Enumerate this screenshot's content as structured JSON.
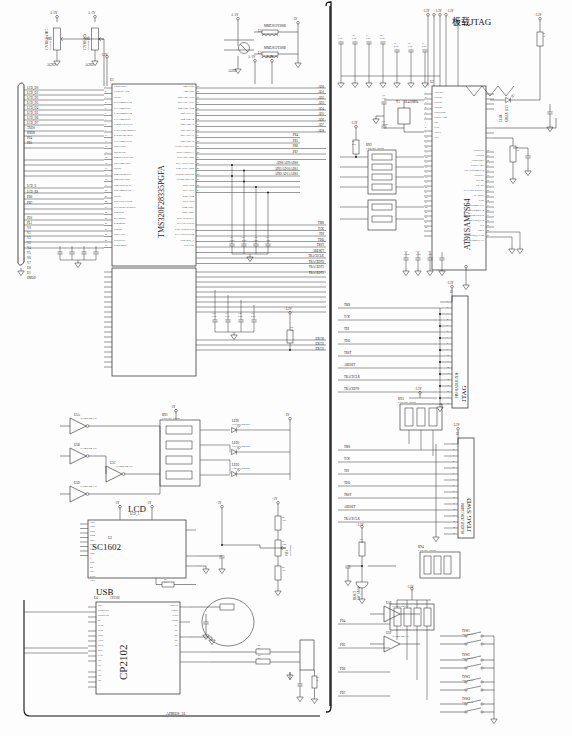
{
  "sheet": {
    "title": "AT91SAM7S64 Development Board Schematic",
    "bottom_net": "ADBUS_31"
  },
  "sections": {
    "onboard_jtag": "板载JTAG",
    "lcd": "LCD",
    "usb": "USB",
    "jtag_swd": "JTAG SWD",
    "jtag_20pin": "JTAG"
  },
  "components": {
    "mcu": {
      "refdes": "U1",
      "part": "TMS320F28335PGFA",
      "left_pins": [
        "CVREFOUT",
        "CVREFP/AN0",
        "DVSS",
        "PA0/TMR0/INT2",
        "PA1/TMR1OUT",
        "PA2/TMR2/INT4",
        "PA3/TMR3OUT",
        "PA4/SCLK/UCTS",
        "PA5/TXD2/TMR0UT",
        "PA6/RXD2/TRG0",
        "PA7/TMR3/INT5",
        "PB0/TXD0",
        "PB1/RXD0",
        "PB2/SCLK0/CTS0",
        "PB3/TMR1OUT",
        "DVDD",
        "PB4/TRG2/INT3",
        "PB5/TRG1OUT",
        "PB6/TRG0/SCS",
        "PB7/TMR0/CLK",
        "DVSS",
        "PC0/T0PL0/INT0",
        "PC1/BUSCLK/RST0",
        "PC2/SCK",
        "PC3/MISO",
        "PC4/MOSI",
        "PC5/SS",
        "PC6/TXD1",
        "PC7/RXD1",
        "PC8/CMOS"
      ],
      "right_pins": [
        "AMP/VDD",
        "AMP/VSS",
        "PB0/AD0/AIN0",
        "PB1/AD1/AIN1",
        "PB2/AD2/AIN2",
        "PB3/AD3/A3",
        "PB4/AD4/A4",
        "PB5/AD5/A5",
        "PB6/AD6/A6",
        "PB7/AD7/A7",
        "PB8/AD8/A8",
        "AVDDA/VREFHA",
        "AVSSA/VREFLA",
        "PC0/AD9/ADS0",
        "PC1/AD10/ADS1",
        "PC2/AD11/ADS2",
        "AVDDB/VREFHB",
        "AVSSB/VREFLB",
        "PD0/AD12",
        "PD1/AD13",
        "PD2/AD14",
        "PD3/AD15",
        "PD4/ADST",
        "PD5/ADSE",
        "PE0/AD16/INT7",
        "PE1/AD17/INT6",
        "PE2/AD18/UINT5",
        "PE3/AD19/UINT4",
        "PE4/TRST_P",
        "PE5/TCK"
      ]
    },
    "arm_mcu": {
      "refdes": "U2",
      "part": "AT91SAM7S64",
      "left_pins": [
        "ADVREF",
        "VDDIO",
        "VDDIO",
        "VDDIO",
        "VDDCORE",
        "VDDFLASH",
        "TDI",
        "TCK",
        "XOUT",
        "XIN"
      ],
      "right_pins": [
        "VDDOUT",
        "VDDIN",
        "VDDCORE",
        "VDDFLASH",
        "TIOA0/PWM0/PA0",
        "VDDPLL",
        "PLLRC",
        "ERASE",
        "PA31/NPCS3/POL3",
        "JTAGSEL",
        "TDO",
        "TIOB0/PWM1/PA1",
        "SCK0/PWM2/PA2",
        "NPCS0/DRXD/PA5",
        "TCLK1/IRQ/PA8",
        "TST",
        "NRST",
        "TCLK2/IRQ1/PA28",
        "TIOB2/PWM3/PA17"
      ]
    },
    "lcd_module": {
      "refdes": "U3",
      "part": "SC1602",
      "connector": "LCD_1",
      "pins": [
        "DB7",
        "DB6",
        "DB5",
        "DB4",
        "DB3",
        "DB2",
        "DB1",
        "DB0",
        "E",
        "R/W",
        "RS",
        "VO",
        "VDD",
        "VSS"
      ]
    },
    "usb_bridge": {
      "refdes": "U4",
      "part": "CP2102",
      "left_pins": [
        "RST",
        "SUSPEND",
        "SUSPEND",
        "RI",
        "DCD",
        "DTR",
        "DSR",
        "TXD",
        "RXD",
        "RTS",
        "CTS",
        "NC",
        "NC",
        "NC",
        "NC",
        "NC"
      ],
      "right_pins": [
        "REGIN",
        "VBUS",
        "GND",
        "VBUS",
        "D+",
        "NC",
        "NC",
        "NC",
        "NC"
      ]
    },
    "inverters": [
      {
        "refdes": "U5A",
        "part": "TC74HC04AFN"
      },
      {
        "refdes": "U5B",
        "part": "TC74HC04AFN"
      },
      {
        "refdes": "U5C",
        "part": "TC74HC04AFN"
      },
      {
        "refdes": "U5D",
        "part": "TC74HC04AFN"
      },
      {
        "refdes": "U5E",
        "part": "TC74HC04AFN"
      },
      {
        "refdes": "U5F",
        "part": "TC74HC04AFN"
      }
    ],
    "pots": [
      {
        "refdes": "VR1",
        "value": "103/4.7K/103",
        "net": "CVREFAHC"
      },
      {
        "refdes": "VR2",
        "value": "103/4.7K/103",
        "net": "CVREFD"
      },
      {
        "refdes": "VR3",
        "value": "103/470HF",
        "label": "LCD contrast"
      }
    ],
    "crystal": {
      "refdes": "Y1",
      "value": "18.432MHz"
    },
    "crystal2": {
      "refdes": "Y2",
      "value": "12MHz"
    },
    "beads": [
      {
        "refdes": "L1",
        "part": "MMZ2012Y300B"
      },
      {
        "refdes": "L2",
        "part": "MMZ2012Y300B"
      }
    ],
    "leds": [
      {
        "refdes": "LED1",
        "part": "LTST-C190KRKT"
      },
      {
        "refdes": "LED2",
        "part": "LTST-C190KRKT"
      },
      {
        "refdes": "LED3",
        "part": "LTST-C190KRKT"
      },
      {
        "refdes": "LED4",
        "part": "LTST-C190KRKT"
      },
      {
        "refdes": "LED5",
        "part": "GREEN LED"
      }
    ],
    "resnets": [
      {
        "refdes": "RN1",
        "value": "EXB-38V 10K*4"
      },
      {
        "refdes": "RN2",
        "value": "EXB-38V 10K*4"
      },
      {
        "refdes": "RN3",
        "value": "EXB-38V 10K*4"
      },
      {
        "refdes": "RN4",
        "value": "EXB-38V 10K*4"
      }
    ],
    "switches": [
      {
        "refdes": "TSW1",
        "part": "SW_SNAP"
      },
      {
        "refdes": "TSW2",
        "part": "SW_SNAP"
      },
      {
        "refdes": "TSW3",
        "part": "SW_SNAP"
      },
      {
        "refdes": "TSW4",
        "part": "SW_SNAP"
      },
      {
        "refdes": "RESET",
        "part": "SW_SNAP"
      }
    ],
    "connectors": [
      {
        "refdes": "J1",
        "label": "JTAG",
        "desc": "PIN HEADER 2X10"
      },
      {
        "refdes": "J2",
        "label": "JTAG SWD",
        "desc": "HEADER 2X10 2.54MM"
      },
      {
        "refdes": "J3",
        "label": "ADBUS_31",
        "desc": "HEADER 2X20"
      }
    ]
  },
  "power_nets": [
    "+3.3V",
    "+5V",
    "A+5V",
    "A+3V",
    "AGND",
    "GND",
    "+3V"
  ],
  "net_labels": {
    "lcd_bus": [
      "LCD_D0",
      "LCD_D1",
      "LCD_D2",
      "LCD_D3",
      "LCD_D4",
      "LCD_D5",
      "LCD_D6",
      "LCD_D7",
      "TXD0",
      "RXD0",
      "PE4",
      "PE5"
    ],
    "lcd_ctrl": [
      "LCD_E",
      "LCD_RS",
      "PB0",
      "PB7"
    ],
    "left_lower": [
      "PL0",
      "PL1",
      "V0",
      "V1",
      "V2",
      "V3",
      "V4",
      "V5",
      "V6",
      "V7",
      "D0",
      "D1",
      "EMOD"
    ],
    "analog": [
      "AD0",
      "AD1",
      "AD2",
      "AD3",
      "AD4",
      "AD5",
      "AD6",
      "AD7",
      "AD8"
    ],
    "port_b": [
      "PB4",
      "PB5",
      "PB6",
      "PB7"
    ],
    "ad_mux": [
      "AIN0/AD9/ADS0",
      "AIN1/AD10/ADS1",
      "AIN2/AD11/ADS2"
    ],
    "jtag": [
      "TMS",
      "TCK",
      "TDI",
      "TDO",
      "TRST",
      "ARESET",
      "TRACECLK",
      "TRACEDT0",
      "TRACEDT1",
      "TRACEDT2"
    ],
    "exec": [
      "EXCI0",
      "EXCI1",
      "EXCI2"
    ],
    "ad_bus": [
      "AD0",
      "AD1",
      "AD2",
      "AD3",
      "ADB0",
      "ADB1",
      "ADB2",
      "ADB3"
    ],
    "uart": [
      "RXD0",
      "TXD0",
      "eRXD_USB"
    ],
    "bottom_ports": [
      "PD4",
      "PD5",
      "PD6",
      "PD7"
    ],
    "vref": [
      "VOUT",
      "VREF"
    ]
  },
  "caps": [
    {
      "refdes": "C1",
      "value": "0.1uF"
    },
    {
      "refdes": "C2",
      "value": "0.1uF"
    },
    {
      "refdes": "C3",
      "value": "0.1uF"
    },
    {
      "refdes": "C4",
      "value": "0.1uF"
    },
    {
      "refdes": "C5",
      "value": "4.7uF"
    },
    {
      "refdes": "C6",
      "value": "0.1uF"
    },
    {
      "refdes": "C7",
      "value": "0.1uF"
    },
    {
      "refdes": "C8",
      "value": "0.1uF"
    },
    {
      "refdes": "C9",
      "value": "4.7uF"
    },
    {
      "refdes": "C10",
      "value": "10pF"
    },
    {
      "refdes": "C11",
      "value": "10pF"
    },
    {
      "refdes": "C12",
      "value": "0.1uF"
    },
    {
      "refdes": "C13",
      "value": "0.1uF"
    },
    {
      "refdes": "C14",
      "value": "0.1uF"
    },
    {
      "refdes": "C15",
      "value": "4.7uF"
    },
    {
      "refdes": "C16",
      "value": "0.1uF"
    },
    {
      "refdes": "C17",
      "value": "1000pF"
    },
    {
      "refdes": "C18",
      "value": "0.01uF"
    },
    {
      "refdes": "C19",
      "value": "0.1uF"
    },
    {
      "refdes": "C20",
      "value": "10uF"
    }
  ],
  "resistors": [
    {
      "refdes": "R1",
      "value": "1K"
    },
    {
      "refdes": "R2",
      "value": "10K"
    },
    {
      "refdes": "R3",
      "value": "4.7K"
    },
    {
      "refdes": "R4",
      "value": "1.5K"
    },
    {
      "refdes": "R5",
      "value": "27"
    },
    {
      "refdes": "R6",
      "value": "27"
    },
    {
      "refdes": "R7",
      "value": "100K"
    },
    {
      "refdes": "R8",
      "value": "10K"
    },
    {
      "refdes": "R9",
      "value": "330"
    },
    {
      "refdes": "R10",
      "value": "1K"
    },
    {
      "refdes": "R11",
      "value": "10K"
    },
    {
      "refdes": "R12",
      "value": "10K"
    }
  ]
}
